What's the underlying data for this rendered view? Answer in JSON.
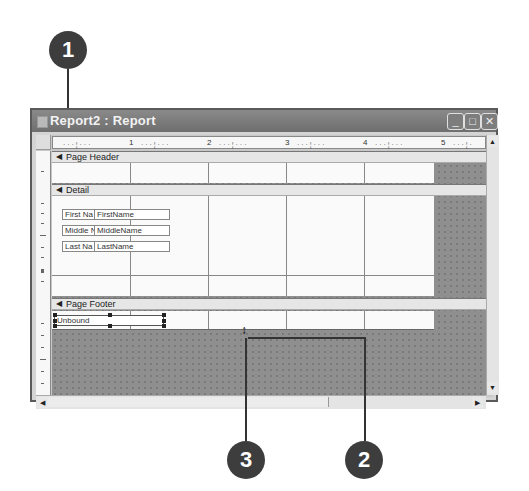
{
  "callouts": [
    {
      "number": "1",
      "target": "title-bar"
    },
    {
      "number": "2",
      "target": "report-width-edge"
    },
    {
      "number": "3",
      "target": "section-resize-cursor"
    }
  ],
  "window": {
    "title": "Report2 : Report",
    "buttons": {
      "minimize": "_",
      "maximize": "□",
      "close": "✕"
    }
  },
  "ruler": {
    "labels": [
      "1",
      "2",
      "3",
      "4",
      "5"
    ]
  },
  "sections": {
    "page_header": {
      "label": "Page Header"
    },
    "detail": {
      "label": "Detail",
      "controls": [
        {
          "label": "First Na",
          "field": "FirstName"
        },
        {
          "label": "Middle N",
          "field": "MiddleName"
        },
        {
          "label": "Last Na",
          "field": "LastName"
        }
      ]
    },
    "page_footer": {
      "label": "Page Footer",
      "controls": [
        {
          "field": "Unbound"
        }
      ]
    }
  },
  "icons": {
    "section_arrow": "◀",
    "scroll_up": "▲",
    "scroll_down": "▼",
    "scroll_left": "◀",
    "scroll_right": "▶",
    "resize_cursor": "↕"
  },
  "colors": {
    "callout": "#3d3d3d",
    "titlebar": "#7a7a7a",
    "background_area": "#8f8f8f",
    "band": "#e6e6e6"
  }
}
